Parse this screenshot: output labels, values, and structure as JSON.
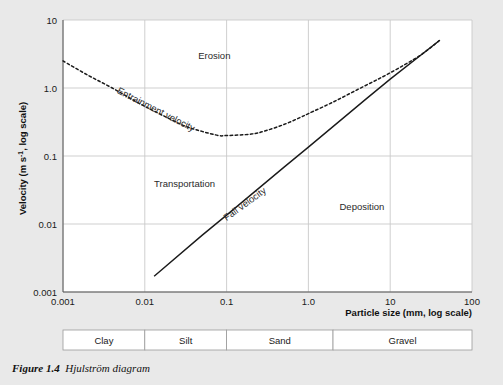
{
  "figure": {
    "caption_label": "Figure 1.4",
    "caption_title": "Hjulström diagram",
    "background_color": "#e9e9e9",
    "plot_background_color": "#ffffff",
    "grid_color": "#c9c9c9",
    "curve_color": "#1a1a1a"
  },
  "chart_data": {
    "type": "line",
    "title": "Hjulström diagram",
    "xlabel": "Particle size (mm, log scale)",
    "ylabel": "Velocity (m s⁻¹, log scale)",
    "xscale": "log",
    "yscale": "log",
    "xlim": [
      0.001,
      100
    ],
    "ylim": [
      0.001,
      10
    ],
    "grid": true,
    "legend": "none",
    "xticks": [
      "0.001",
      "0.01",
      "0.1",
      "1.0",
      "10",
      "100"
    ],
    "xtick_values": [
      0.001,
      0.01,
      0.1,
      1.0,
      10,
      100
    ],
    "yticks": [
      "0.001",
      "0.01",
      "0.1",
      "1.0",
      "10"
    ],
    "ytick_values": [
      0.001,
      0.01,
      0.1,
      1.0,
      10
    ],
    "series": [
      {
        "name": "Entrainment velocity",
        "style": "dashed",
        "x": [
          0.001,
          0.002,
          0.004,
          0.008,
          0.015,
          0.03,
          0.05,
          0.08,
          0.1,
          0.2,
          0.3,
          0.5,
          0.8,
          1.0,
          2.0,
          4.0,
          8.0,
          15.0,
          25.0,
          40.0
        ],
        "y": [
          2.5,
          1.55,
          1.0,
          0.62,
          0.42,
          0.28,
          0.23,
          0.2,
          0.2,
          0.21,
          0.235,
          0.29,
          0.37,
          0.42,
          0.62,
          0.95,
          1.45,
          2.2,
          3.2,
          5.0
        ]
      },
      {
        "name": "Fall velocity",
        "style": "solid",
        "x": [
          0.013,
          0.05,
          0.1,
          0.5,
          1.0,
          5.0,
          10.0,
          40.0
        ],
        "y": [
          0.0017,
          0.0068,
          0.0135,
          0.068,
          0.135,
          0.68,
          1.35,
          5.0
        ]
      }
    ],
    "annotations": [
      {
        "text": "Erosion",
        "x": 0.045,
        "y": 2.7,
        "rotation": 0
      },
      {
        "text": "Transportation",
        "x": 0.013,
        "y": 0.035,
        "rotation": 0
      },
      {
        "text": "Deposition",
        "x": 2.4,
        "y": 0.016,
        "rotation": 0
      },
      {
        "text": "Entrainment velocity",
        "x": 0.0045,
        "y": 0.85,
        "rotation": 27
      },
      {
        "text": "Fall velocity",
        "x": 0.1,
        "y": 0.011,
        "rotation": -36
      }
    ]
  },
  "axes": {
    "x_title": "Particle size (mm, log scale)",
    "y_title_prefix": "Velocity (m s",
    "y_title_sup": "-1",
    "y_title_suffix": ", log scale)",
    "x_tick_labels": [
      "0.001",
      "0.01",
      "0.1",
      "1.0",
      "10",
      "100"
    ],
    "y_tick_labels": [
      "10",
      "1.0",
      "0.1",
      "0.01",
      "0.001"
    ]
  },
  "regions": {
    "erosion": "Erosion",
    "transportation": "Transportation",
    "deposition": "Deposition"
  },
  "curves": {
    "entrainment": "Entrainment velocity",
    "fall": "Fall velocity"
  },
  "classification": {
    "items": [
      {
        "label": "Clay",
        "from": 0.001,
        "to": 0.01
      },
      {
        "label": "Silt",
        "from": 0.01,
        "to": 0.1
      },
      {
        "label": "Sand",
        "from": 0.1,
        "to": 2.0
      },
      {
        "label": "Gravel",
        "from": 2.0,
        "to": 100
      }
    ]
  }
}
